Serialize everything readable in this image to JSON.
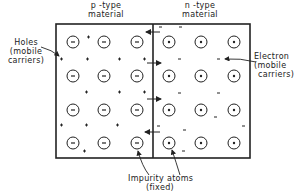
{
  "labels": {
    "p_type": [
      "p -type",
      "material"
    ],
    "n_type": [
      "n -type",
      "material"
    ],
    "holes": [
      "Holes",
      "(mobile",
      "carriers)"
    ],
    "electron": [
      "Electron",
      "(mobile",
      "carriers)"
    ],
    "impurity": [
      "Impurity atoms",
      "(fixed)"
    ]
  },
  "symbols": {
    "acceptor_ion": "−",
    "donor_ion": "+",
    "hole": "+",
    "electron": "−"
  },
  "colors": {
    "ink": "#222222",
    "background": "#ffffff"
  }
}
